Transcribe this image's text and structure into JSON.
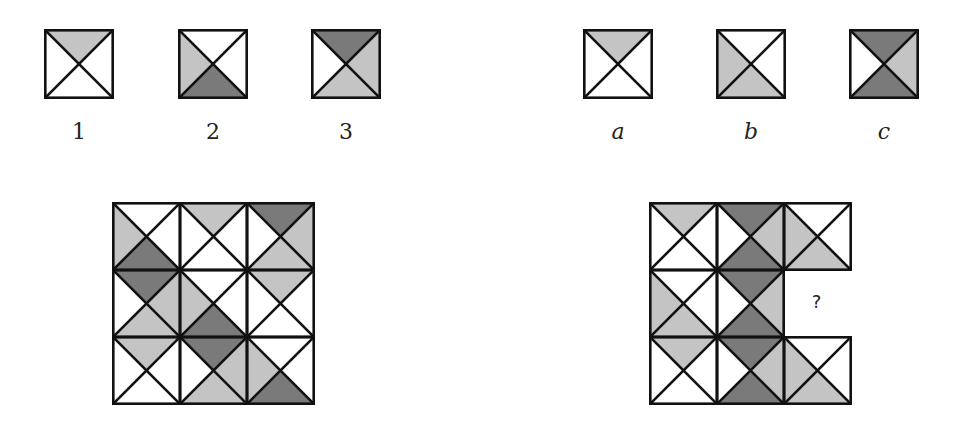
{
  "colors": {
    "w": "#ffffff",
    "l": "#c4c4c4",
    "d": "#7a7a7a",
    "stroke": "#111111"
  },
  "tile_defs": {
    "1": {
      "top": "l",
      "right": "w",
      "bottom": "w",
      "left": "w"
    },
    "2": {
      "top": "w",
      "right": "w",
      "bottom": "d",
      "left": "l"
    },
    "3": {
      "top": "d",
      "right": "l",
      "bottom": "l",
      "left": "w"
    },
    "a": {
      "top": "l",
      "right": "w",
      "bottom": "w",
      "left": "w"
    },
    "b": {
      "top": "w",
      "right": "w",
      "bottom": "l",
      "left": "l"
    },
    "c": {
      "top": "d",
      "right": "l",
      "bottom": "d",
      "left": "w"
    }
  },
  "top_row": [
    {
      "id": "1",
      "label": "1",
      "x": 44,
      "italic": false
    },
    {
      "id": "2",
      "label": "2",
      "x": 178,
      "italic": false
    },
    {
      "id": "3",
      "label": "3",
      "x": 311,
      "italic": false
    },
    {
      "id": "a",
      "label": "a",
      "x": 583,
      "italic": true
    },
    {
      "id": "b",
      "label": "b",
      "x": 716,
      "italic": true
    },
    {
      "id": "c",
      "label": "c",
      "x": 849,
      "italic": true
    }
  ],
  "left_grid": {
    "x": 112,
    "y": 202,
    "cell": 67,
    "rows": [
      [
        "2",
        "1",
        "3"
      ],
      [
        "3",
        "2",
        "1"
      ],
      [
        "1",
        "3",
        "2"
      ]
    ]
  },
  "right_grid": {
    "x": 649,
    "y": 202,
    "cell": 67,
    "rows": [
      [
        "a",
        "c",
        "b"
      ],
      [
        "b",
        "c",
        null
      ],
      [
        "a",
        "c",
        "b"
      ]
    ],
    "missing_label": "?"
  }
}
